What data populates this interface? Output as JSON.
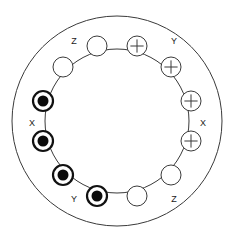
{
  "diagram": {
    "background_color": "#ffffff",
    "line_color": "#3a3a3a",
    "conductor_fill_color": "#0b0b0b",
    "geometry": {
      "center_x": 117,
      "center_y": 121,
      "outer_radius": 105,
      "inner_radius": 72,
      "slot_radius": 77,
      "slot_circle_radius": 10
    },
    "labels": [
      {
        "id": "label-z-top",
        "text": "Z",
        "x": 74,
        "y": 42
      },
      {
        "id": "label-y-top",
        "text": "Y",
        "x": 174,
        "y": 42
      },
      {
        "id": "label-x-left",
        "text": "X",
        "x": 32,
        "y": 124
      },
      {
        "id": "label-x-right",
        "text": "X",
        "x": 203,
        "y": 124
      },
      {
        "id": "label-y-bottom",
        "text": "Y",
        "x": 74,
        "y": 200
      },
      {
        "id": "label-z-bottom",
        "text": "Z",
        "x": 174,
        "y": 200
      }
    ],
    "slots": [
      {
        "id": "slot-1",
        "type": "cross",
        "angle_deg": -75,
        "x": 137,
        "y": 46,
        "symbol": "+"
      },
      {
        "id": "slot-2",
        "type": "cross",
        "angle_deg": -45,
        "x": 171,
        "y": 67,
        "symbol": "+"
      },
      {
        "id": "slot-3",
        "type": "cross",
        "angle_deg": -15,
        "x": 191,
        "y": 101,
        "symbol": "+"
      },
      {
        "id": "slot-4",
        "type": "cross",
        "angle_deg": 15,
        "x": 191,
        "y": 141,
        "symbol": "+"
      },
      {
        "id": "slot-5",
        "type": "empty",
        "angle_deg": 45,
        "x": 171,
        "y": 175,
        "symbol": ""
      },
      {
        "id": "slot-6",
        "type": "empty",
        "angle_deg": 75,
        "x": 137,
        "y": 196,
        "symbol": ""
      },
      {
        "id": "slot-7",
        "type": "dot",
        "angle_deg": 105,
        "x": 97,
        "y": 196,
        "symbol": "●"
      },
      {
        "id": "slot-8",
        "type": "dot",
        "angle_deg": 135,
        "x": 63,
        "y": 175,
        "symbol": "●"
      },
      {
        "id": "slot-9",
        "type": "dot",
        "angle_deg": 165,
        "x": 43,
        "y": 141,
        "symbol": "●"
      },
      {
        "id": "slot-10",
        "type": "dot",
        "angle_deg": 195,
        "x": 43,
        "y": 101,
        "symbol": "●"
      },
      {
        "id": "slot-11",
        "type": "empty",
        "angle_deg": 225,
        "x": 63,
        "y": 67,
        "symbol": ""
      },
      {
        "id": "slot-12",
        "type": "empty",
        "angle_deg": 255,
        "x": 97,
        "y": 46,
        "symbol": ""
      }
    ]
  }
}
